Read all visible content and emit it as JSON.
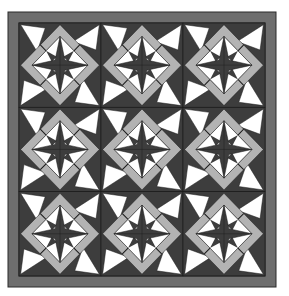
{
  "image": {
    "subject": "quilt-pattern",
    "layout": {
      "rows": 3,
      "cols": 3
    },
    "colors": {
      "background": "#ffffff",
      "border": "#6e6e6e",
      "dark": "#3d3d3d",
      "light": "#b3b3b3",
      "white": "#ffffff",
      "line": "#1a1a1a"
    }
  }
}
